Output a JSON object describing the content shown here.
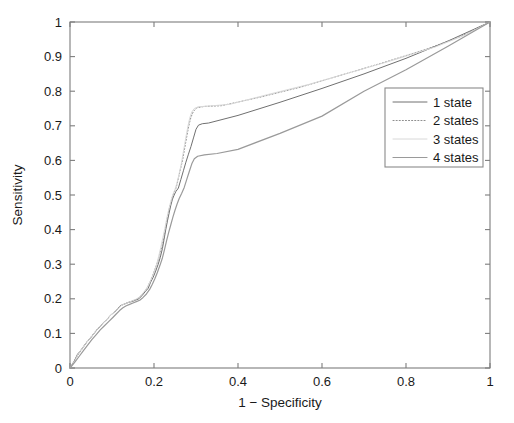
{
  "chart_data": {
    "type": "line",
    "title": "",
    "xlabel": "1 − Specificity",
    "ylabel": "Sensitivity",
    "xlim": [
      0,
      1
    ],
    "ylim": [
      0,
      1
    ],
    "grid": false,
    "legend_position": "right",
    "xticks": [
      "0",
      "0.2",
      "0.4",
      "0.6",
      "0.8",
      "1"
    ],
    "xtick_values": [
      0,
      0.2,
      0.4,
      0.6,
      0.8,
      1
    ],
    "yticks": [
      "0",
      "0.1",
      "0.2",
      "0.3",
      "0.4",
      "0.5",
      "0.6",
      "0.7",
      "0.8",
      "0.9",
      "1"
    ],
    "ytick_values": [
      0,
      0.1,
      0.2,
      0.3,
      0.4,
      0.5,
      0.6,
      0.7,
      0.8,
      0.9,
      1
    ],
    "series": [
      {
        "name": "1 state",
        "style": "solid",
        "color": "#707070",
        "width": 1.0,
        "points": [
          [
            0.0,
            0.0
          ],
          [
            0.01,
            0.02
          ],
          [
            0.018,
            0.04
          ],
          [
            0.025,
            0.05
          ],
          [
            0.032,
            0.062
          ],
          [
            0.04,
            0.075
          ],
          [
            0.048,
            0.085
          ],
          [
            0.056,
            0.098
          ],
          [
            0.064,
            0.11
          ],
          [
            0.072,
            0.12
          ],
          [
            0.08,
            0.132
          ],
          [
            0.088,
            0.14
          ],
          [
            0.096,
            0.152
          ],
          [
            0.104,
            0.16
          ],
          [
            0.112,
            0.168
          ],
          [
            0.118,
            0.178
          ],
          [
            0.124,
            0.182
          ],
          [
            0.132,
            0.186
          ],
          [
            0.14,
            0.19
          ],
          [
            0.148,
            0.192
          ],
          [
            0.156,
            0.196
          ],
          [
            0.164,
            0.2
          ],
          [
            0.172,
            0.21
          ],
          [
            0.18,
            0.222
          ],
          [
            0.186,
            0.23
          ],
          [
            0.192,
            0.248
          ],
          [
            0.198,
            0.262
          ],
          [
            0.204,
            0.28
          ],
          [
            0.21,
            0.3
          ],
          [
            0.215,
            0.32
          ],
          [
            0.22,
            0.345
          ],
          [
            0.224,
            0.372
          ],
          [
            0.228,
            0.4
          ],
          [
            0.232,
            0.425
          ],
          [
            0.236,
            0.448
          ],
          [
            0.24,
            0.47
          ],
          [
            0.244,
            0.488
          ],
          [
            0.248,
            0.5
          ],
          [
            0.252,
            0.51
          ],
          [
            0.258,
            0.52
          ],
          [
            0.264,
            0.545
          ],
          [
            0.27,
            0.57
          ],
          [
            0.276,
            0.595
          ],
          [
            0.282,
            0.618
          ],
          [
            0.288,
            0.64
          ],
          [
            0.294,
            0.665
          ],
          [
            0.3,
            0.69
          ],
          [
            0.306,
            0.702
          ],
          [
            0.315,
            0.706
          ],
          [
            0.33,
            0.708
          ],
          [
            0.4,
            0.73
          ],
          [
            0.5,
            0.768
          ],
          [
            0.6,
            0.808
          ],
          [
            0.7,
            0.85
          ],
          [
            0.8,
            0.895
          ],
          [
            0.9,
            0.945
          ],
          [
            1.0,
            1.0
          ]
        ]
      },
      {
        "name": "2 states",
        "style": "dotted",
        "color": "#8f8f8f",
        "width": 1.0,
        "points": [
          [
            0.0,
            0.0
          ],
          [
            0.01,
            0.018
          ],
          [
            0.018,
            0.036
          ],
          [
            0.026,
            0.05
          ],
          [
            0.034,
            0.064
          ],
          [
            0.042,
            0.078
          ],
          [
            0.05,
            0.09
          ],
          [
            0.058,
            0.102
          ],
          [
            0.066,
            0.114
          ],
          [
            0.074,
            0.124
          ],
          [
            0.082,
            0.134
          ],
          [
            0.09,
            0.144
          ],
          [
            0.098,
            0.154
          ],
          [
            0.106,
            0.162
          ],
          [
            0.114,
            0.172
          ],
          [
            0.12,
            0.18
          ],
          [
            0.128,
            0.184
          ],
          [
            0.136,
            0.188
          ],
          [
            0.144,
            0.192
          ],
          [
            0.152,
            0.196
          ],
          [
            0.16,
            0.2
          ],
          [
            0.168,
            0.208
          ],
          [
            0.176,
            0.218
          ],
          [
            0.184,
            0.232
          ],
          [
            0.19,
            0.248
          ],
          [
            0.196,
            0.265
          ],
          [
            0.202,
            0.285
          ],
          [
            0.208,
            0.305
          ],
          [
            0.214,
            0.328
          ],
          [
            0.219,
            0.352
          ],
          [
            0.224,
            0.38
          ],
          [
            0.228,
            0.408
          ],
          [
            0.232,
            0.435
          ],
          [
            0.236,
            0.458
          ],
          [
            0.24,
            0.478
          ],
          [
            0.244,
            0.495
          ],
          [
            0.248,
            0.508
          ],
          [
            0.253,
            0.522
          ],
          [
            0.258,
            0.548
          ],
          [
            0.263,
            0.575
          ],
          [
            0.268,
            0.6
          ],
          [
            0.272,
            0.628
          ],
          [
            0.276,
            0.655
          ],
          [
            0.28,
            0.682
          ],
          [
            0.284,
            0.706
          ],
          [
            0.288,
            0.725
          ],
          [
            0.294,
            0.742
          ],
          [
            0.302,
            0.752
          ],
          [
            0.32,
            0.756
          ],
          [
            0.36,
            0.758
          ],
          [
            0.45,
            0.782
          ],
          [
            0.55,
            0.812
          ],
          [
            0.65,
            0.848
          ],
          [
            0.75,
            0.884
          ],
          [
            0.85,
            0.922
          ],
          [
            0.93,
            0.958
          ],
          [
            1.0,
            1.0
          ]
        ]
      },
      {
        "name": "3 states",
        "style": "solid",
        "color": "#d8d8d8",
        "width": 1.0,
        "points": [
          [
            0.0,
            0.0
          ],
          [
            0.012,
            0.022
          ],
          [
            0.02,
            0.042
          ],
          [
            0.028,
            0.055
          ],
          [
            0.036,
            0.068
          ],
          [
            0.044,
            0.08
          ],
          [
            0.052,
            0.092
          ],
          [
            0.06,
            0.105
          ],
          [
            0.068,
            0.116
          ],
          [
            0.076,
            0.126
          ],
          [
            0.084,
            0.136
          ],
          [
            0.092,
            0.146
          ],
          [
            0.1,
            0.156
          ],
          [
            0.108,
            0.164
          ],
          [
            0.116,
            0.174
          ],
          [
            0.124,
            0.182
          ],
          [
            0.132,
            0.186
          ],
          [
            0.14,
            0.19
          ],
          [
            0.148,
            0.194
          ],
          [
            0.156,
            0.198
          ],
          [
            0.164,
            0.204
          ],
          [
            0.172,
            0.214
          ],
          [
            0.18,
            0.226
          ],
          [
            0.188,
            0.242
          ],
          [
            0.194,
            0.258
          ],
          [
            0.2,
            0.278
          ],
          [
            0.206,
            0.298
          ],
          [
            0.211,
            0.322
          ],
          [
            0.216,
            0.348
          ],
          [
            0.221,
            0.376
          ],
          [
            0.226,
            0.404
          ],
          [
            0.23,
            0.43
          ],
          [
            0.234,
            0.452
          ],
          [
            0.238,
            0.472
          ],
          [
            0.242,
            0.49
          ],
          [
            0.246,
            0.504
          ],
          [
            0.25,
            0.516
          ],
          [
            0.255,
            0.536
          ],
          [
            0.26,
            0.562
          ],
          [
            0.265,
            0.59
          ],
          [
            0.269,
            0.618
          ],
          [
            0.273,
            0.646
          ],
          [
            0.277,
            0.674
          ],
          [
            0.281,
            0.7
          ],
          [
            0.285,
            0.722
          ],
          [
            0.29,
            0.74
          ],
          [
            0.296,
            0.75
          ],
          [
            0.305,
            0.755
          ],
          [
            0.33,
            0.757
          ],
          [
            0.38,
            0.762
          ],
          [
            0.47,
            0.79
          ],
          [
            0.57,
            0.82
          ],
          [
            0.67,
            0.855
          ],
          [
            0.77,
            0.89
          ],
          [
            0.87,
            0.928
          ],
          [
            0.94,
            0.962
          ],
          [
            1.0,
            1.0
          ]
        ]
      },
      {
        "name": "4 states",
        "style": "solid",
        "color": "#9a9a9a",
        "width": 1.2,
        "points": [
          [
            0.0,
            0.0
          ],
          [
            0.012,
            0.018
          ],
          [
            0.022,
            0.034
          ],
          [
            0.032,
            0.05
          ],
          [
            0.042,
            0.066
          ],
          [
            0.052,
            0.082
          ],
          [
            0.062,
            0.096
          ],
          [
            0.072,
            0.11
          ],
          [
            0.082,
            0.122
          ],
          [
            0.092,
            0.134
          ],
          [
            0.102,
            0.146
          ],
          [
            0.11,
            0.156
          ],
          [
            0.118,
            0.166
          ],
          [
            0.126,
            0.174
          ],
          [
            0.134,
            0.18
          ],
          [
            0.142,
            0.184
          ],
          [
            0.15,
            0.188
          ],
          [
            0.158,
            0.192
          ],
          [
            0.166,
            0.196
          ],
          [
            0.174,
            0.204
          ],
          [
            0.182,
            0.214
          ],
          [
            0.19,
            0.228
          ],
          [
            0.196,
            0.242
          ],
          [
            0.202,
            0.258
          ],
          [
            0.208,
            0.276
          ],
          [
            0.214,
            0.296
          ],
          [
            0.22,
            0.318
          ],
          [
            0.225,
            0.342
          ],
          [
            0.23,
            0.368
          ],
          [
            0.235,
            0.392
          ],
          [
            0.24,
            0.414
          ],
          [
            0.245,
            0.436
          ],
          [
            0.25,
            0.456
          ],
          [
            0.255,
            0.474
          ],
          [
            0.26,
            0.49
          ],
          [
            0.266,
            0.505
          ],
          [
            0.272,
            0.522
          ],
          [
            0.278,
            0.545
          ],
          [
            0.284,
            0.568
          ],
          [
            0.29,
            0.59
          ],
          [
            0.296,
            0.605
          ],
          [
            0.304,
            0.612
          ],
          [
            0.32,
            0.616
          ],
          [
            0.35,
            0.62
          ],
          [
            0.4,
            0.632
          ],
          [
            0.5,
            0.678
          ],
          [
            0.6,
            0.728
          ],
          [
            0.7,
            0.8
          ],
          [
            0.8,
            0.862
          ],
          [
            0.9,
            0.93
          ],
          [
            1.0,
            1.0
          ]
        ]
      }
    ]
  },
  "axes": {
    "x_title": "1 − Specificity",
    "y_title": "Sensitivity"
  },
  "legend": {
    "entries": [
      {
        "label": "1 state"
      },
      {
        "label": "2 states"
      },
      {
        "label": "3 states"
      },
      {
        "label": "4 states"
      }
    ]
  }
}
